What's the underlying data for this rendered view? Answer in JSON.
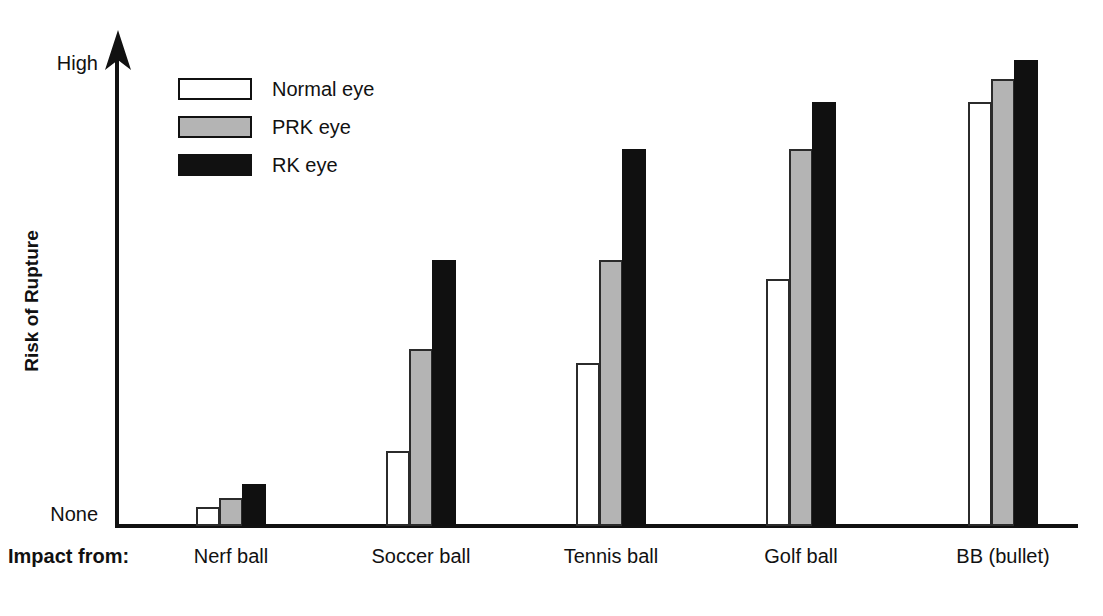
{
  "chart_data": {
    "type": "bar",
    "title": "",
    "subtitle": "",
    "xlabel": "Impact from:",
    "ylabel": "Risk of Rupture",
    "categories": [
      "Nerf ball",
      "Soccer ball",
      "Tennis ball",
      "Golf ball",
      "BB (bullet)"
    ],
    "series": [
      {
        "name": "Normal eye",
        "color": "#ffffff",
        "values": [
          4,
          16,
          35,
          53,
          91
        ]
      },
      {
        "name": "PRK eye",
        "color": "#b4b4b4",
        "values": [
          6,
          38,
          57,
          81,
          96
        ]
      },
      {
        "name": "RK eye",
        "color": "#101010",
        "values": [
          9,
          57,
          81,
          91,
          100
        ]
      }
    ],
    "ytick_labels": [
      "None",
      "High"
    ],
    "ylim": [
      0,
      100
    ],
    "ylim_labels": {
      "min": "None",
      "max": "High"
    },
    "grid": false,
    "legend_position": "top-left",
    "axis_style": "arrow-y-axis"
  },
  "axis": {
    "y_title": "Risk of Rupture",
    "y_top_label": "High",
    "y_bottom_label": "None",
    "x_prefix_label": "Impact from:"
  },
  "legend": {
    "items": [
      {
        "label": "Normal eye",
        "swatch": "white"
      },
      {
        "label": "PRK eye",
        "swatch": "gray"
      },
      {
        "label": "RK eye",
        "swatch": "black"
      }
    ]
  },
  "colors": {
    "ink": "#111111",
    "normal_eye": "#ffffff",
    "prk_eye": "#b4b4b4",
    "rk_eye": "#101010",
    "background": "#ffffff"
  }
}
